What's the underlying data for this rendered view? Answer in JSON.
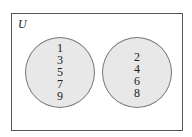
{
  "diagram": {
    "type": "venn",
    "universe_label": "U",
    "sets": [
      {
        "name": "left-set",
        "elements": [
          "1",
          "3",
          "5",
          "7",
          "9"
        ]
      },
      {
        "name": "right-set",
        "elements": [
          "2",
          "4",
          "6",
          "8"
        ]
      }
    ],
    "colors": {
      "set_fill": "#e8e8e8",
      "set_border": "#777777",
      "universe_border": "#555555"
    }
  }
}
